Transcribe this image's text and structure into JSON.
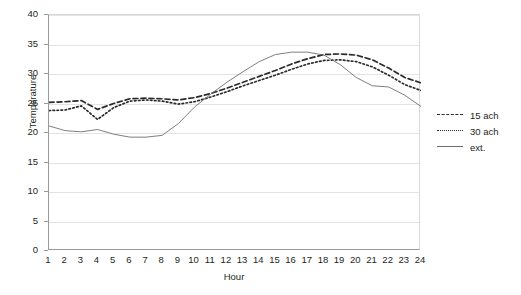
{
  "chart_data": {
    "type": "line",
    "title": "",
    "xlabel": "Hour",
    "ylabel": "Temperature",
    "xlim": [
      1,
      24
    ],
    "ylim": [
      0,
      40
    ],
    "ytick_step": 5,
    "grid": true,
    "legend_position": "right",
    "categories": [
      1,
      2,
      3,
      4,
      5,
      6,
      7,
      8,
      9,
      10,
      11,
      12,
      13,
      14,
      15,
      16,
      17,
      18,
      19,
      20,
      21,
      22,
      23,
      24
    ],
    "xticklabels": [
      "1",
      "2",
      "3",
      "4",
      "5",
      "6",
      "7",
      "8",
      "9",
      "10",
      "11",
      "12",
      "13",
      "14",
      "15",
      "16",
      "17",
      "18",
      "19",
      "20",
      "21",
      "22",
      "23",
      "24"
    ],
    "yticklabels": [
      "0",
      "5",
      "10",
      "15",
      "20",
      "25",
      "30",
      "35",
      "40"
    ],
    "series": [
      {
        "name": "15 ach",
        "style": "dashed",
        "color": "#2b2b2b",
        "values": [
          25.2,
          25.3,
          25.5,
          24.0,
          25.0,
          25.8,
          25.9,
          25.8,
          25.6,
          26.0,
          26.7,
          27.6,
          28.6,
          29.6,
          30.6,
          31.7,
          32.6,
          33.3,
          33.4,
          33.2,
          32.4,
          31.0,
          29.4,
          28.5
        ]
      },
      {
        "name": "30 ach",
        "style": "dotted",
        "color": "#2b2b2b",
        "values": [
          23.8,
          23.9,
          24.6,
          22.3,
          24.3,
          25.4,
          25.6,
          25.4,
          24.9,
          25.3,
          26.1,
          27.0,
          28.0,
          28.9,
          29.8,
          30.8,
          31.7,
          32.3,
          32.4,
          32.1,
          31.2,
          29.8,
          28.2,
          27.2
        ]
      },
      {
        "name": "ext.",
        "style": "solid",
        "color": "#6f6f6f",
        "values": [
          21.2,
          20.4,
          20.2,
          20.6,
          19.8,
          19.3,
          19.3,
          19.6,
          21.6,
          24.4,
          26.6,
          28.6,
          30.4,
          32.1,
          33.3,
          33.7,
          33.7,
          33.2,
          31.6,
          29.4,
          28.0,
          27.8,
          26.4,
          24.5
        ]
      }
    ]
  },
  "legend": {
    "items": [
      {
        "label": "15 ach"
      },
      {
        "label": "30 ach"
      },
      {
        "label": "ext."
      }
    ]
  }
}
